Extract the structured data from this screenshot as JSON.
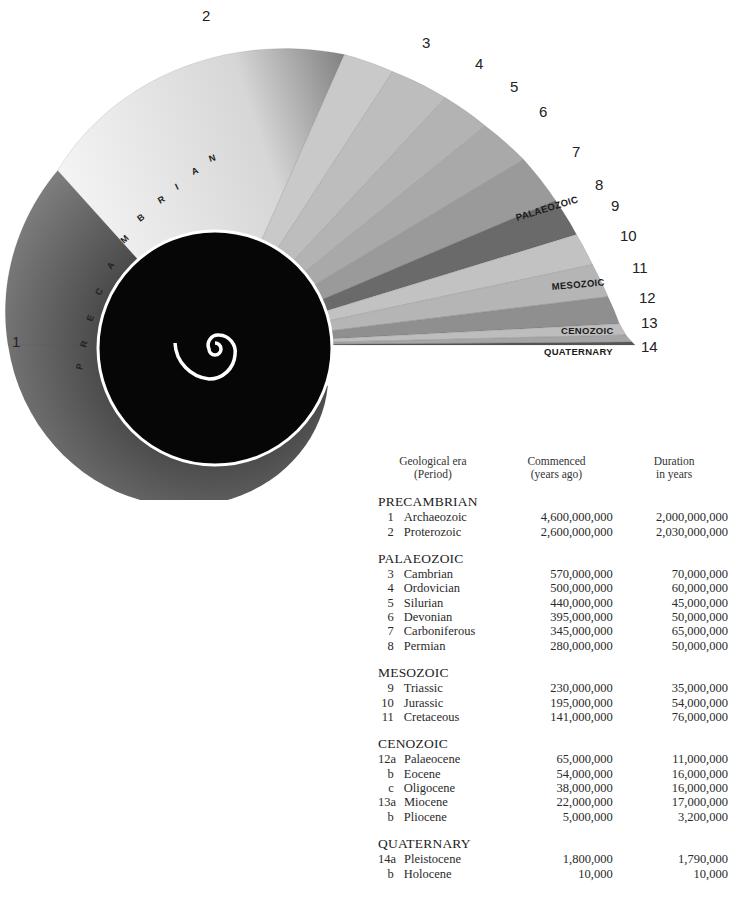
{
  "diagram": {
    "type": "spiral-timeline",
    "outer_numbers": [
      "1",
      "2",
      "3",
      "4",
      "5",
      "6",
      "7",
      "8",
      "9",
      "10",
      "11",
      "12",
      "13",
      "14"
    ],
    "era_labels": {
      "precambrian": "PRECAMBRIAN",
      "palaeozoic": "PALAEOZOIC",
      "mesozoic": "MESOZOIC",
      "cenozoic": "CENOZOIC",
      "quaternary": "QUATERNARY"
    }
  },
  "table": {
    "headers": {
      "era_line1": "Geological era",
      "era_line2": "(Period)",
      "commenced_line1": "Commenced",
      "commenced_line2": "(years ago)",
      "duration_line1": "Duration",
      "duration_line2": "in years"
    },
    "groups": [
      {
        "era": "PRECAMBRIAN",
        "rows": [
          {
            "idx": "1",
            "period": "Archaeozoic",
            "commenced": "4,600,000,000",
            "duration": "2,000,000,000"
          },
          {
            "idx": "2",
            "period": "Proterozoic",
            "commenced": "2,600,000,000",
            "duration": "2,030,000,000"
          }
        ]
      },
      {
        "era": "PALAEOZOIC",
        "rows": [
          {
            "idx": "3",
            "period": "Cambrian",
            "commenced": "570,000,000",
            "duration": "70,000,000"
          },
          {
            "idx": "4",
            "period": "Ordovician",
            "commenced": "500,000,000",
            "duration": "60,000,000"
          },
          {
            "idx": "5",
            "period": "Silurian",
            "commenced": "440,000,000",
            "duration": "45,000,000"
          },
          {
            "idx": "6",
            "period": "Devonian",
            "commenced": "395,000,000",
            "duration": "50,000,000"
          },
          {
            "idx": "7",
            "period": "Carboniferous",
            "commenced": "345,000,000",
            "duration": "65,000,000"
          },
          {
            "idx": "8",
            "period": "Permian",
            "commenced": "280,000,000",
            "duration": "50,000,000"
          }
        ]
      },
      {
        "era": "MESOZOIC",
        "rows": [
          {
            "idx": "9",
            "period": "Triassic",
            "commenced": "230,000,000",
            "duration": "35,000,000"
          },
          {
            "idx": "10",
            "period": "Jurassic",
            "commenced": "195,000,000",
            "duration": "54,000,000"
          },
          {
            "idx": "11",
            "period": "Cretaceous",
            "commenced": "141,000,000",
            "duration": "76,000,000"
          }
        ]
      },
      {
        "era": "CENOZOIC",
        "rows": [
          {
            "idx": "12a",
            "period": "Palaeocene",
            "commenced": "65,000,000",
            "duration": "11,000,000"
          },
          {
            "idx": "b",
            "period": "Eocene",
            "commenced": "54,000,000",
            "duration": "16,000,000"
          },
          {
            "idx": "c",
            "period": "Oligocene",
            "commenced": "38,000,000",
            "duration": "16,000,000"
          },
          {
            "idx": "13a",
            "period": "Miocene",
            "commenced": "22,000,000",
            "duration": "17,000,000"
          },
          {
            "idx": "b",
            "period": "Pliocene",
            "commenced": "5,000,000",
            "duration": "3,200,000"
          }
        ]
      },
      {
        "era": "QUATERNARY",
        "rows": [
          {
            "idx": "14a",
            "period": "Pleistocene",
            "commenced": "1,800,000",
            "duration": "1,790,000"
          },
          {
            "idx": "b",
            "period": "Holocene",
            "commenced": "10,000",
            "duration": "10,000"
          }
        ]
      }
    ]
  }
}
